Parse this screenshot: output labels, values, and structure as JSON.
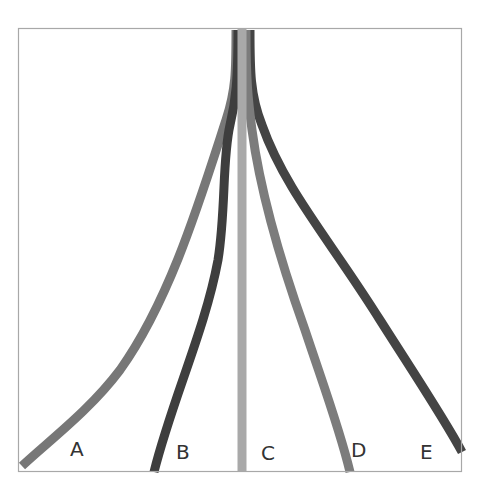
{
  "diagram": {
    "type": "branching-strands",
    "frame": {
      "x": 18,
      "y": 28,
      "width": 444,
      "height": 444,
      "border_color": "#a8a8a8"
    },
    "origin": {
      "x": 240,
      "y": 28
    },
    "strands": [
      {
        "id": "A",
        "label": "A",
        "color": "#777777",
        "end_x": 22,
        "end_y": 470
      },
      {
        "id": "B",
        "label": "B",
        "color": "#3e3e3e",
        "end_x": 153,
        "end_y": 472
      },
      {
        "id": "C",
        "label": "C",
        "color": "#a9a9a9",
        "end_x": 242,
        "end_y": 472
      },
      {
        "id": "D",
        "label": "D",
        "color": "#7c7c7c",
        "end_x": 350,
        "end_y": 472
      },
      {
        "id": "E",
        "label": "E",
        "color": "#444444",
        "end_x": 462,
        "end_y": 458
      }
    ],
    "labels": [
      {
        "text": "A",
        "x": 70,
        "y": 437
      },
      {
        "text": "B",
        "x": 176,
        "y": 440
      },
      {
        "text": "C",
        "x": 261,
        "y": 441
      },
      {
        "text": "D",
        "x": 351,
        "y": 438
      },
      {
        "text": "E",
        "x": 420,
        "y": 440
      }
    ]
  }
}
